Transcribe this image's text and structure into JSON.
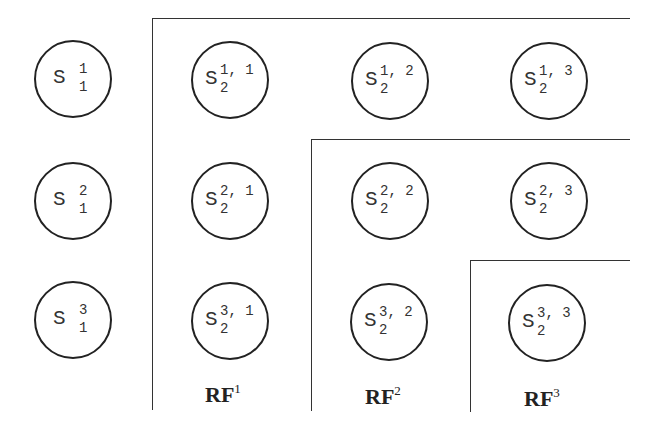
{
  "nodes_level1": [
    {
      "base": "S",
      "sup": "1",
      "sub": "1"
    },
    {
      "base": "S",
      "sup": "2",
      "sub": "1"
    },
    {
      "base": "S",
      "sup": "3",
      "sub": "1"
    }
  ],
  "nodes_level2": [
    [
      {
        "base": "S",
        "sup": "1, 1",
        "sub": "2"
      },
      {
        "base": "S",
        "sup": "1, 2",
        "sub": "2"
      },
      {
        "base": "S",
        "sup": "1, 3",
        "sub": "2"
      }
    ],
    [
      {
        "base": "S",
        "sup": "2, 1",
        "sub": "2"
      },
      {
        "base": "S",
        "sup": "2, 2",
        "sub": "2"
      },
      {
        "base": "S",
        "sup": "2, 3",
        "sub": "2"
      }
    ],
    [
      {
        "base": "S",
        "sup": "3, 1",
        "sub": "2"
      },
      {
        "base": "S",
        "sup": "3, 2",
        "sub": "2"
      },
      {
        "base": "S",
        "sup": "3, 3",
        "sub": "2"
      }
    ]
  ],
  "regions": [
    {
      "label": "RF",
      "sup": "1"
    },
    {
      "label": "RF",
      "sup": "2"
    },
    {
      "label": "RF",
      "sup": "3"
    }
  ]
}
